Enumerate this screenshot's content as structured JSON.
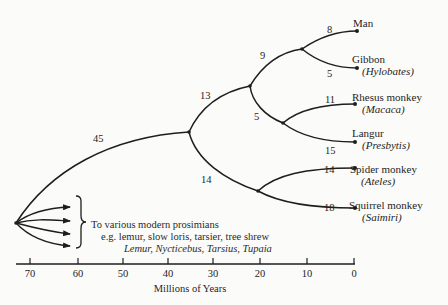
{
  "diagram": {
    "type": "phylogenetic-tree",
    "branch_labels": {
      "root_to_anthropoid": "45",
      "anthropoid_to_oldworld": "13",
      "anthropoid_to_newworld": "14",
      "oldworld_to_hominoid": "9",
      "oldworld_to_cercopithecoid": "5",
      "man": "8",
      "gibbon": "5",
      "rhesus": "11",
      "langur": "15",
      "spider": "14",
      "squirrel": "18"
    },
    "taxa": [
      {
        "common": "Man",
        "genus": ""
      },
      {
        "common": "Gibbon",
        "genus": "(Hylobates)"
      },
      {
        "common": "Rhesus monkey",
        "genus": "(Macaca)"
      },
      {
        "common": "Langur",
        "genus": "(Presbytis)"
      },
      {
        "common": "Spider monkey",
        "genus": "(Ateles)"
      },
      {
        "common": "Squirrel monkey",
        "genus": "(Saimiri)"
      }
    ],
    "prosimian_note": {
      "line1": "To various modern prosimians",
      "line2": "e.g. lemur, slow loris, tarsier, tree shrew",
      "line3": "Lemur, Nycticebus, Tarsius, Tupaia"
    },
    "axis": {
      "label": "Millions of Years",
      "ticks": [
        "70",
        "60",
        "50",
        "40",
        "30",
        "20",
        "10",
        "0"
      ]
    }
  },
  "colors": {
    "ink": "#1e1e1e",
    "background": "#fbfbf9"
  }
}
